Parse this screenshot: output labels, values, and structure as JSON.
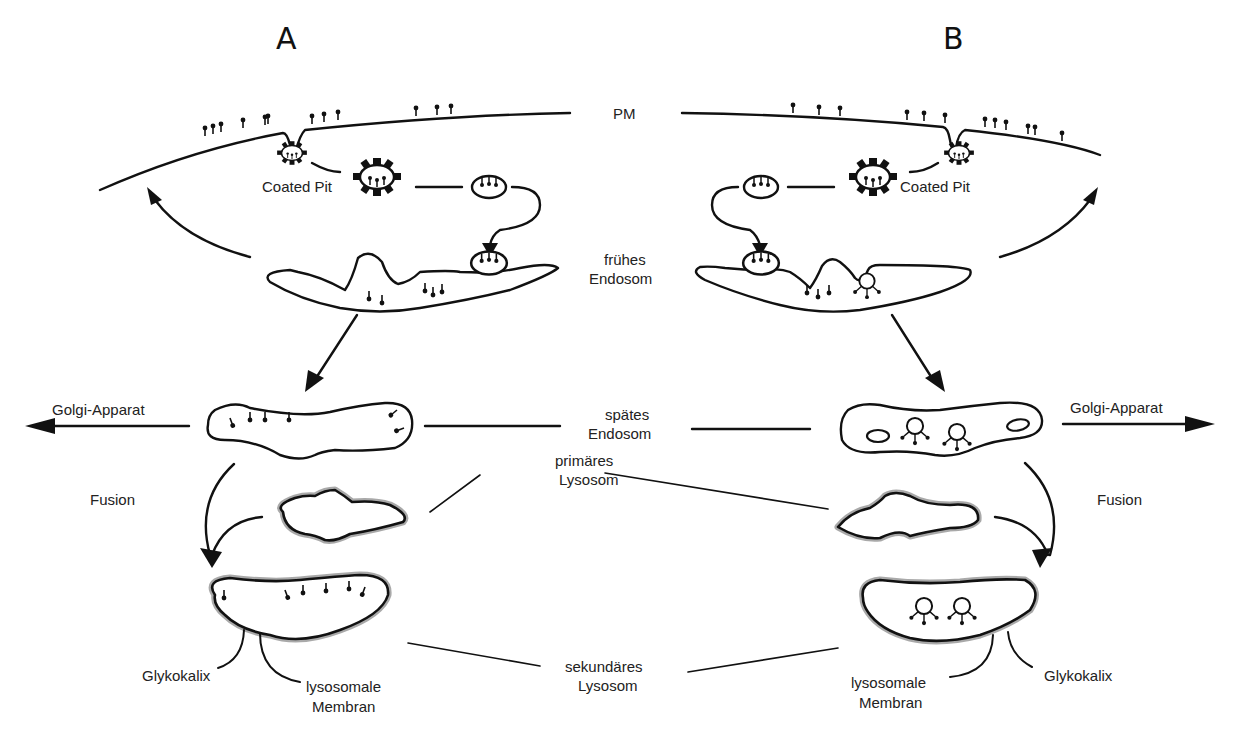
{
  "panels": {
    "a": {
      "label": "A"
    },
    "b": {
      "label": "B"
    }
  },
  "labels": {
    "plasma_membrane": "PM",
    "coated_pit_a": "Coated Pit",
    "coated_pit_b": "Coated Pit",
    "early_endosome_line1": "frühes",
    "early_endosome_line2": "Endosom",
    "golgi_a": "Golgi-Apparat",
    "golgi_b": "Golgi-Apparat",
    "late_endosome_line1": "spätes",
    "late_endosome_line2": "Endosom",
    "fusion_a": "Fusion",
    "fusion_b": "Fusion",
    "primary_lysosome_line1": "primäres",
    "primary_lysosome_line2": "Lysosom",
    "secondary_lysosome_line1": "sekundäres",
    "secondary_lysosome_line2": "Lysosom",
    "glycocalyx_a": "Glykokalix",
    "glycocalyx_b": "Glykokalix",
    "lysosomal_membrane_a_line1": "lysosomale",
    "lysosomal_membrane_a_line2": "Membran",
    "lysosomal_membrane_b_line1": "lysosomale",
    "lysosomal_membrane_b_line2": "Membran"
  },
  "colors": {
    "line": "#111111",
    "membrane_shading": "#9a9a9a",
    "background": "#ffffff"
  }
}
